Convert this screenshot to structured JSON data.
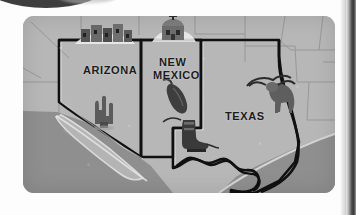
{
  "figure": {
    "kind": "scanned-pictorial-map",
    "region": "American Southwest",
    "background_color": "#ffffff",
    "map_fill_color": "#b7b7b7",
    "ocean_color": "#8f8f8f",
    "outline_color": "#101010",
    "state_line_color": "#8a8a8a",
    "label_color": "#1b1b1b"
  },
  "labels": {
    "arizona": "ARIZONA",
    "new_mexico_line1": "NEW",
    "new_mexico_line2": "MEXICO",
    "texas": "TEXAS"
  },
  "icons": [
    {
      "name": "cliff-dwelling-icon",
      "label": "cliff dwelling",
      "state": "ARIZONA"
    },
    {
      "name": "mission-church-icon",
      "label": "mission church",
      "state": "NEW MEXICO"
    },
    {
      "name": "saguaro-cactus-icon",
      "label": "saguaro cactus",
      "state": "ARIZONA"
    },
    {
      "name": "chili-pepper-icon",
      "label": "chili pepper",
      "state": "NEW MEXICO"
    },
    {
      "name": "cowboy-boot-icon",
      "label": "cowboy boot",
      "state": "TEXAS"
    },
    {
      "name": "longhorn-steer-icon",
      "label": "longhorn steer",
      "state": "TEXAS"
    }
  ],
  "water_features": [
    {
      "name": "gulf-of-california",
      "label": "Gulf of California"
    },
    {
      "name": "gulf-of-mexico",
      "label": "Gulf of Mexico"
    },
    {
      "name": "pacific-ocean",
      "label": "Pacific Ocean"
    }
  ],
  "landforms": [
    {
      "name": "baja-california-peninsula",
      "label": "Baja California"
    }
  ],
  "page_edge": {
    "name": "scanned-page-edge",
    "side": "right"
  }
}
